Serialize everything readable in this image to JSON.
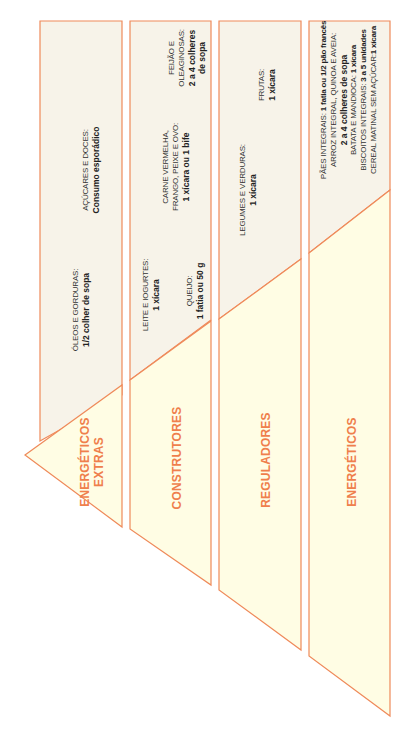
{
  "colors": {
    "outline": "#ef8a5a",
    "upper_fill": "#f7f3e9",
    "lower_fill": "#fffde4",
    "category_text": "#ef7f4c"
  },
  "groups": [
    {
      "category": "ENERGÉTICOS EXTRAS",
      "category_lines": [
        "ENERGÉTICOS",
        "EXTRAS"
      ],
      "items": [
        {
          "label": "AÇÚCARES E DOCES:",
          "amount": "Consumo esporádico"
        },
        {
          "label": "ÓLEOS E GORDURAS:",
          "amount": "1/2 colher de sopa"
        }
      ]
    },
    {
      "category": "CONSTRUTORES",
      "items": [
        {
          "label": "FEIJÃO E",
          "label2": "OLEAGINOSAS:",
          "amount": "2 a 4 colheres",
          "amount2": "de sopa"
        },
        {
          "label": "CARNE VERMELHA,",
          "label2": "FRANGO, PEIXE E OVO:",
          "amount": "1 xícara ou 1 bife"
        },
        {
          "label": "LEITE E IOGURTES:",
          "amount": "1 xícara"
        },
        {
          "label": "QUEIJO:",
          "amount": "1 fatia ou 50 g"
        }
      ]
    },
    {
      "category": "REGULADORES",
      "items": [
        {
          "label": "FRUTAS:",
          "amount": "1 xícara"
        },
        {
          "label": "LEGUMES E VERDURAS:",
          "amount": "1 xícara"
        }
      ]
    },
    {
      "category": "ENERGÉTICOS",
      "items": [
        {
          "label": "PÃES INTEGRAIS:",
          "amount": "1 fatia ou 1/2 pão francês"
        },
        {
          "label": "ARROZ INTEGRAL, QUINOA E AVEIA:",
          "amount": "2 a 4 colheres de sopa"
        },
        {
          "label": "BATATA E MANDIOCA:",
          "amount": "1 xícara"
        },
        {
          "label": "BISCOITOS INTEGRAIS:",
          "amount": "3 a 5 unidades"
        },
        {
          "label": "CEREAL MATINAL SEM AÇÚCAR:",
          "amount": "1 xícara"
        }
      ]
    }
  ]
}
